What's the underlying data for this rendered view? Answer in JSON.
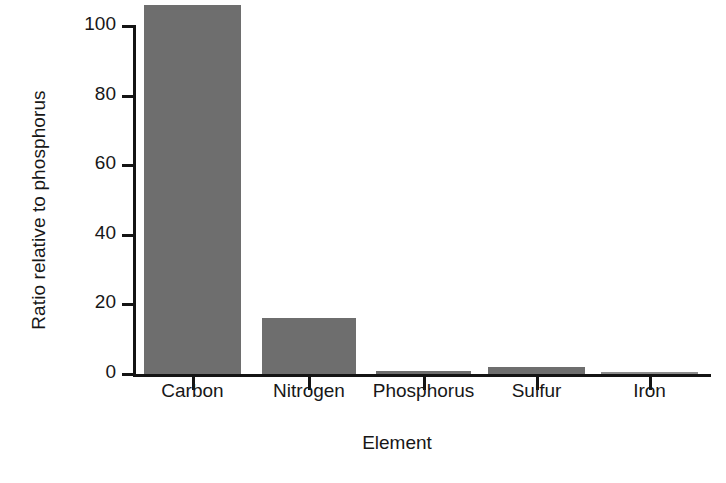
{
  "chart_data": {
    "type": "bar",
    "title": "",
    "xlabel": "Element",
    "ylabel": "Ratio relative to phosphorus",
    "categories": [
      "Carbon",
      "Nitrogen",
      "Phosphorus",
      "Sulfur",
      "Iron"
    ],
    "values": [
      106,
      16,
      1,
      2,
      0.2
    ],
    "ylim": [
      0,
      106
    ],
    "yticks": [
      0,
      20,
      40,
      60,
      80,
      100
    ],
    "ytick_labels": [
      "0",
      "20",
      "40",
      "60",
      "80",
      "100"
    ],
    "grid": false,
    "legend": null,
    "bar_color": "#6e6e6e",
    "axis_color": "#141414",
    "background": "#ffffff"
  }
}
